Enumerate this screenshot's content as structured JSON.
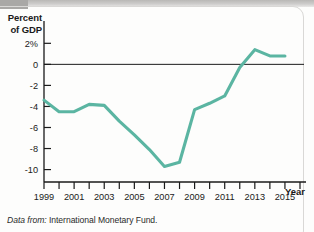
{
  "figure": {
    "caption_lead": "Data from:",
    "caption_source": "International Monetary Fund.",
    "line_color": "#5bb5a2",
    "axis_color": "#1a1a1a"
  },
  "chart_data": {
    "type": "line",
    "title": "",
    "subtitle": "",
    "xlabel": "Year",
    "ylabel": "Percent of GDP",
    "ylabel_lines": [
      "Percent",
      "of GDP"
    ],
    "grid": false,
    "legend": "none",
    "zero_line": true,
    "xlim": [
      1999,
      2016
    ],
    "ylim": [
      -10.8,
      2.6
    ],
    "xticks": [
      1999,
      2000,
      2001,
      2002,
      2003,
      2004,
      2005,
      2006,
      2007,
      2008,
      2009,
      2010,
      2011,
      2012,
      2013,
      2014,
      2015,
      2016
    ],
    "xtick_labels": [
      "1999",
      "",
      "2001",
      "",
      "2003",
      "",
      "2005",
      "",
      "2007",
      "",
      "2009",
      "",
      "2011",
      "",
      "2013",
      "",
      "2015",
      ""
    ],
    "yticks": [
      2,
      0,
      -2,
      -4,
      -6,
      -8,
      -10
    ],
    "ytick_labels": [
      "2%",
      "0",
      "-2",
      "-4",
      "-6",
      "-8",
      "-10"
    ],
    "series": [
      {
        "name": "Budget balance",
        "color": "#5bb5a2",
        "x": [
          1999,
          2000,
          2001,
          2002,
          2003,
          2004,
          2005,
          2006,
          2007,
          2008,
          2009,
          2010,
          2011,
          2012,
          2013,
          2014,
          2015
        ],
        "values": [
          -3.4,
          -4.5,
          -4.5,
          -3.8,
          -3.9,
          -5.4,
          -6.7,
          -8.1,
          -9.7,
          -9.3,
          -4.3,
          -3.7,
          -3.0,
          -0.3,
          1.4,
          0.8,
          0.8
        ]
      }
    ]
  }
}
